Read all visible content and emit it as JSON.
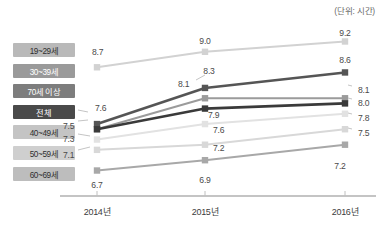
{
  "unit_note": "(단위: 시간)",
  "chart_data": {
    "type": "line",
    "title": "",
    "xlabel": "",
    "ylabel": "",
    "unit": "시간",
    "grid": false,
    "legend_position": "left",
    "categories": [
      "2014년",
      "2015년",
      "2016년"
    ],
    "ylim": [
      6.4,
      9.5
    ],
    "series": [
      {
        "name": "19~29세",
        "values": [
          8.7,
          9.0,
          9.2
        ],
        "color": "#d2d2d2",
        "legend_bg": "#b9b9b9",
        "legend_fg": "#2f2f2f"
      },
      {
        "name": "30~39세",
        "values": [
          7.6,
          8.3,
          8.6
        ],
        "color": "#555555",
        "legend_bg": "#9a9a9a",
        "legend_fg": "#ffffff"
      },
      {
        "name": "70세 이상",
        "values": [
          7.5,
          8.1,
          8.1
        ],
        "color": "#9b9b9b",
        "legend_bg": "#7d7d7d",
        "legend_fg": "#ffffff"
      },
      {
        "name": "전체",
        "values": [
          7.5,
          7.9,
          8.0
        ],
        "color": "#3a3a3a",
        "legend_bg": "#4a4a4a",
        "legend_fg": "#ffffff"
      },
      {
        "name": "40~49세",
        "values": [
          7.3,
          7.6,
          7.8
        ],
        "color": "#e2e2e2",
        "legend_bg": "#c4c4c4",
        "legend_fg": "#2f2f2f"
      },
      {
        "name": "50~59세",
        "values": [
          7.1,
          7.2,
          7.5
        ],
        "color": "#d8d8d8",
        "legend_bg": "#cfcfcf",
        "legend_fg": "#2f2f2f"
      },
      {
        "name": "60~69세",
        "values": [
          6.7,
          6.9,
          7.2
        ],
        "color": "#a8a8a8",
        "legend_bg": "#bdbdbd",
        "legend_fg": "#2f2f2f"
      }
    ],
    "point_labels": [
      {
        "text": "8.7",
        "x": 92,
        "y": 47,
        "anchor": "start"
      },
      {
        "text": "9.0",
        "x": 205,
        "y": 36,
        "anchor": "middle"
      },
      {
        "text": "9.2",
        "x": 345,
        "y": 28,
        "anchor": "middle"
      },
      {
        "text": "7.6",
        "x": 95,
        "y": 103,
        "anchor": "start"
      },
      {
        "text": "8.3",
        "x": 209,
        "y": 66,
        "anchor": "middle"
      },
      {
        "text": "8.6",
        "x": 345,
        "y": 55,
        "anchor": "middle"
      },
      {
        "text": "7.5",
        "x": 63,
        "y": 110,
        "anchor": "start"
      },
      {
        "text": "8.1",
        "x": 178,
        "y": 79,
        "anchor": "start"
      },
      {
        "text": "8.1",
        "x": 358,
        "y": 85,
        "anchor": "start"
      },
      {
        "text": "7.5",
        "x": 63,
        "y": 121,
        "anchor": "start"
      },
      {
        "text": "7.9",
        "x": 208,
        "y": 110,
        "anchor": "start"
      },
      {
        "text": "8.0",
        "x": 358,
        "y": 98,
        "anchor": "start"
      },
      {
        "text": "7.3",
        "x": 63,
        "y": 134,
        "anchor": "start"
      },
      {
        "text": "7.6",
        "x": 213,
        "y": 125,
        "anchor": "start"
      },
      {
        "text": "7.8",
        "x": 358,
        "y": 113,
        "anchor": "start"
      },
      {
        "text": "7.1",
        "x": 63,
        "y": 150,
        "anchor": "start"
      },
      {
        "text": "7.2",
        "x": 213,
        "y": 143,
        "anchor": "start"
      },
      {
        "text": "7.5",
        "x": 358,
        "y": 128,
        "anchor": "start"
      },
      {
        "text": "6.7",
        "x": 97,
        "y": 180,
        "anchor": "middle"
      },
      {
        "text": "6.9",
        "x": 205,
        "y": 175,
        "anchor": "middle"
      },
      {
        "text": "7.2",
        "x": 340,
        "y": 161,
        "anchor": "middle"
      }
    ]
  }
}
